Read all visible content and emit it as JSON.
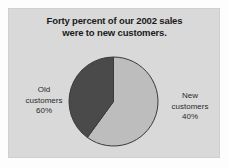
{
  "figure": {
    "background_color": "#fdfdfd",
    "panel_color": "#d9d9d9",
    "panel_border_color": "#cfcfcf"
  },
  "title": {
    "line1": "Forty percent of our 2002 sales",
    "line2": "were to new customers."
  },
  "labels": {
    "old": {
      "name": "Old",
      "line1": "Old",
      "line2": "customers",
      "line3": "60%"
    },
    "new": {
      "name": "New",
      "line1": "New",
      "line2": "customers",
      "line3": "40%"
    }
  },
  "chart_data": {
    "type": "pie",
    "title": "Forty percent of our 2002 sales were to new customers.",
    "xlabel": "",
    "ylabel": "",
    "categories": [
      "Old customers",
      "New customers"
    ],
    "values": [
      60,
      40
    ],
    "value_unit": "%",
    "slices": [
      {
        "label": "Old customers",
        "value": 60,
        "display_value": "60%",
        "color": "#bdbdbd",
        "start_angle_deg": 144,
        "end_angle_deg": 360,
        "sweep_deg": 216,
        "label_position": "left"
      },
      {
        "label": "New customers",
        "value": 40,
        "display_value": "40%",
        "color": "#4a4a4a",
        "start_angle_deg": 0,
        "end_angle_deg": 144,
        "sweep_deg": 144,
        "label_position": "right"
      }
    ],
    "start_angle_deg": 0,
    "direction": "clockwise",
    "legend": "none",
    "grid": false,
    "outline_color": "#3a3a3a"
  }
}
